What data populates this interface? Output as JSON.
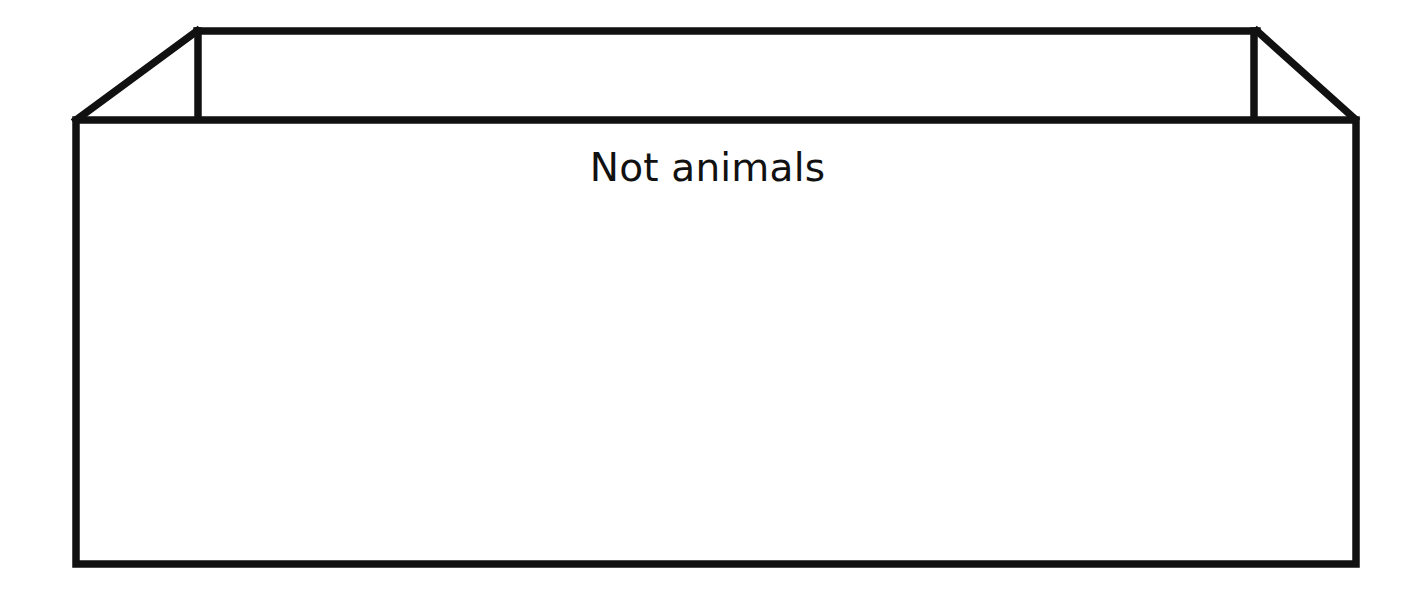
{
  "diagram": {
    "type": "open-box-sorting-container",
    "label": "Not animals",
    "stroke_color": "#111111",
    "background_color": "#ffffff"
  }
}
